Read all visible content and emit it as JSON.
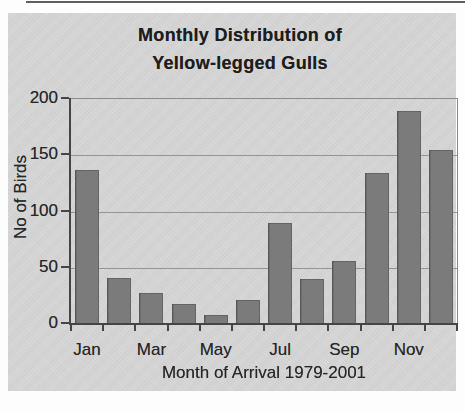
{
  "chart": {
    "title_line1": "Monthly Distribution of",
    "title_line2": "Yellow-legged Gulls",
    "colors": {
      "background": "#d6d6d6",
      "bar": "#7b7b7b",
      "grid": "#949494",
      "axis": "#454545",
      "text": "#262626"
    }
  },
  "chart_data": {
    "type": "bar",
    "title": "Monthly Distribution of Yellow-legged Gulls",
    "xlabel": "Month of Arrival 1979-2001",
    "ylabel": "No of Birds",
    "categories": [
      "Jan",
      "Feb",
      "Mar",
      "Apr",
      "May",
      "Jun",
      "Jul",
      "Aug",
      "Sep",
      "Oct",
      "Nov",
      "Dec"
    ],
    "values": [
      137,
      41,
      28,
      18,
      8,
      21,
      90,
      40,
      56,
      134,
      189,
      155
    ],
    "x_axis_labels_shown": [
      "Jan",
      "Mar",
      "May",
      "Jul",
      "Sep",
      "Nov"
    ],
    "x_labeled_indices": [
      0,
      2,
      4,
      6,
      8,
      10
    ],
    "y_ticks": [
      0,
      50,
      100,
      150,
      200
    ],
    "ylim": [
      0,
      200
    ],
    "grid": true,
    "legend_position": "none"
  }
}
